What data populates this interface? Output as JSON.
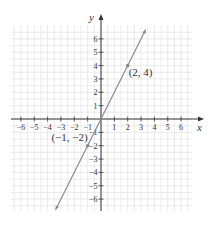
{
  "chart_data": {
    "type": "line",
    "title": "",
    "xlabel": "x",
    "ylabel": "y",
    "xlim": [
      -6.7,
      6.8
    ],
    "ylim": [
      -6.9,
      7.0
    ],
    "grid": true,
    "x_ticks": [
      -6,
      -5,
      -4,
      -3,
      -2,
      -1,
      1,
      2,
      3,
      4,
      5,
      6
    ],
    "y_ticks": [
      -6,
      -5,
      -4,
      -3,
      -2,
      -1,
      1,
      2,
      3,
      4,
      5,
      6
    ],
    "x_tick_labels": [
      "−6",
      "−5",
      "−4",
      "−3",
      "−2",
      "−1",
      "1",
      "2",
      "3",
      "4",
      "5",
      "6"
    ],
    "y_tick_labels": [
      "−6",
      "−5",
      "−4",
      "−3",
      "−2",
      "−1",
      "1",
      "2",
      "3",
      "4",
      "5",
      "6"
    ],
    "series": [
      {
        "name": "y = 2x",
        "x": [
          -3.4,
          3.35
        ],
        "y": [
          -6.8,
          6.7
        ],
        "color": "#8a8a8a",
        "arrows": "both"
      }
    ],
    "points": [
      {
        "x": 2,
        "y": 4,
        "label": "(2, 4)"
      },
      {
        "x": -1,
        "y": -2,
        "label": "(−1, −2)"
      }
    ]
  }
}
